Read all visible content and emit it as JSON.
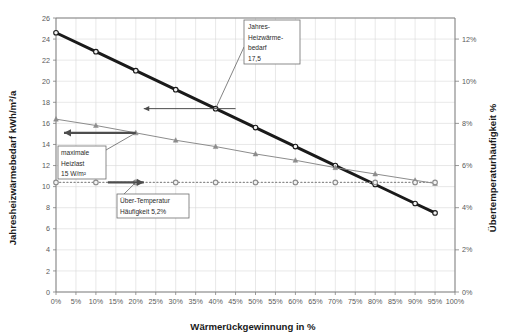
{
  "chart_data": {
    "type": "line",
    "title": "",
    "xlabel": "Wärmerückgewinnung in  %",
    "ylabel": "Jahresheizwärmebedarf  kWh/m²/a",
    "y2label": "Übertemperaturhäufigkeit %",
    "xlim": [
      0,
      100
    ],
    "ylim": [
      0,
      26
    ],
    "y2lim": [
      0,
      13
    ],
    "grid": true,
    "legend": "none",
    "xticklabels": [
      "0%",
      "5%",
      "10%",
      "15%",
      "20%",
      "25%",
      "30%",
      "35%",
      "40%",
      "45%",
      "50%",
      "55%",
      "60%",
      "65%",
      "70%",
      "75%",
      "80%",
      "85%",
      "90%",
      "95%",
      "100%"
    ],
    "xtickvalues": [
      0,
      5,
      10,
      15,
      20,
      25,
      30,
      35,
      40,
      45,
      50,
      55,
      60,
      65,
      70,
      75,
      80,
      85,
      90,
      95,
      100
    ],
    "yticklabels": [
      "0",
      "2",
      "4",
      "6",
      "8",
      "10",
      "12",
      "14",
      "16",
      "18",
      "20",
      "22",
      "24",
      "26"
    ],
    "ytickvalues": [
      0,
      2,
      4,
      6,
      8,
      10,
      12,
      14,
      16,
      18,
      20,
      22,
      24,
      26
    ],
    "y2ticklabels": [
      "0%",
      "2%",
      "4%",
      "6%",
      "8%",
      "10%",
      "12%"
    ],
    "y2tickvalues": [
      0,
      2,
      4,
      6,
      8,
      10,
      12
    ],
    "x": [
      0,
      10,
      20,
      30,
      40,
      50,
      60,
      70,
      80,
      90,
      95
    ],
    "series": [
      {
        "name": "Jahresheizwärmebedarf",
        "axis": "left",
        "color": "#1a1a1a",
        "style": "solid-thick",
        "marker": "circle",
        "values": [
          24.6,
          22.8,
          21.0,
          19.2,
          17.4,
          15.6,
          13.8,
          12.0,
          10.2,
          8.4,
          7.5
        ]
      },
      {
        "name": "maximale Heizlast",
        "axis": "left",
        "color": "#8c8c8c",
        "style": "solid-thin",
        "marker": "triangle",
        "values": [
          16.4,
          15.8,
          15.1,
          14.4,
          13.8,
          13.1,
          12.5,
          11.8,
          11.2,
          10.6,
          10.3
        ]
      },
      {
        "name": "Übertemperaturhäufigkeit",
        "axis": "right",
        "color": "#8c8c8c",
        "style": "dotted",
        "marker": "circle",
        "values": [
          5.2,
          5.2,
          5.2,
          5.2,
          5.2,
          5.2,
          5.2,
          5.2,
          5.2,
          5.2,
          5.2
        ]
      }
    ],
    "annotations": [
      {
        "id": "jahres-heizwaermebedarf",
        "lines": [
          "Jahres-",
          "Heizwärme-",
          "bedarf",
          "17,5"
        ],
        "points_to_x": 40,
        "points_to_y": 17.4
      },
      {
        "id": "maximale-heizlast",
        "lines": [
          "maximale",
          "Heizlast",
          "15 W/m²"
        ],
        "points_to_x": 20,
        "points_to_y": 15.1
      },
      {
        "id": "ueber-temperatur",
        "lines": [
          "Über-Temperatur",
          "Häufigkeit 5,2%"
        ],
        "points_to_x": 20,
        "points_to_y": 5.2
      }
    ],
    "axis_arrows": [
      {
        "id": "arrow-to-left-axis-thin",
        "from_x": 45,
        "to_x": 22,
        "at_y": 17.4,
        "weight": "thin"
      },
      {
        "id": "arrow-to-left-axis-thick",
        "from_x": 20,
        "to_x": 2,
        "at_y": 15.1,
        "weight": "thick"
      },
      {
        "id": "arrow-to-right-axis",
        "from_x": 13,
        "to_x": 22,
        "at_y2": 5.2,
        "weight": "thick"
      }
    ]
  }
}
